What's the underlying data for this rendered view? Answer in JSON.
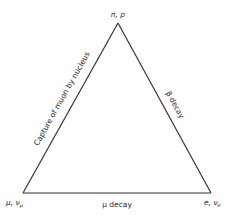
{
  "diagram": {
    "type": "triangle",
    "vertices": {
      "top": {
        "label": "n, p"
      },
      "bottom_left": {
        "label_main": "μ, ν",
        "label_sub": "μ"
      },
      "bottom_right": {
        "label_main": "e, ν",
        "label_sub": "e"
      }
    },
    "edges": {
      "left": {
        "label": "Capture of muon by nucleus"
      },
      "right": {
        "label": "β decay"
      },
      "bottom": {
        "label": "μ decay"
      }
    },
    "colors": {
      "line": "#333333",
      "text": "#2a2a2a",
      "background": "#ffffff"
    }
  }
}
